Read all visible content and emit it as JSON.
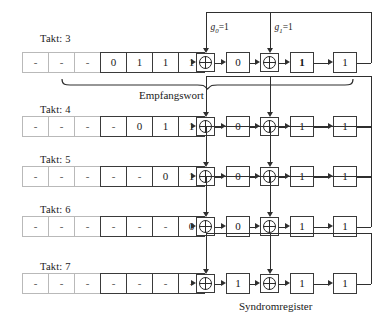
{
  "figure": {
    "title_visible": false,
    "colors": {
      "ink": "#2f2f2f",
      "faint_border": "#b9b9b9",
      "strong_border": "#3a3a3a",
      "background": "#ffffff"
    }
  },
  "taps": {
    "g0": "g",
    "g0_sub": "0",
    "g0_eq": "=1",
    "g1": "g",
    "g1_sub": "1",
    "g1_eq": "=1"
  },
  "captions": {
    "empfangswort": "Empfangswort",
    "syndromregister": "Syndromregister"
  },
  "rows": [
    {
      "takt_label": "Takt: 3",
      "input_cells": [
        "-",
        "-",
        "-",
        "0",
        "1",
        "1",
        "1"
      ],
      "input_cell_styles": [
        "faint",
        "faint",
        "faint",
        "strong",
        "strong",
        "strong",
        "strong"
      ],
      "registers": [
        "0",
        "1",
        "1"
      ],
      "register_bold": [
        false,
        true,
        false
      ],
      "xor_count": 2
    },
    {
      "takt_label": "Takt: 4",
      "input_cells": [
        "-",
        "-",
        "-",
        "-",
        "0",
        "1",
        "1"
      ],
      "input_cell_styles": [
        "faint",
        "faint",
        "faint",
        "strong",
        "strong",
        "strong",
        "strong"
      ],
      "registers": [
        "0",
        "1",
        "1"
      ],
      "register_bold": [
        false,
        false,
        false
      ],
      "xor_count": 2
    },
    {
      "takt_label": "Takt: 5",
      "input_cells": [
        "-",
        "-",
        "-",
        "-",
        "-",
        "0",
        "1"
      ],
      "input_cell_styles": [
        "faint",
        "faint",
        "faint",
        "strong",
        "strong",
        "strong",
        "strong"
      ],
      "registers": [
        "0",
        "1",
        "1"
      ],
      "register_bold": [
        false,
        false,
        false
      ],
      "xor_count": 2
    },
    {
      "takt_label": "Takt: 6",
      "input_cells": [
        "-",
        "-",
        "-",
        "-",
        "-",
        "-",
        "0"
      ],
      "input_cell_styles": [
        "faint",
        "faint",
        "faint",
        "strong",
        "strong",
        "strong",
        "strong"
      ],
      "registers": [
        "0",
        "1",
        "1"
      ],
      "register_bold": [
        false,
        false,
        false
      ],
      "xor_count": 2
    },
    {
      "takt_label": "Takt: 7",
      "input_cells": [
        "-",
        "-",
        "-",
        "-",
        "-",
        "-",
        "-"
      ],
      "input_cell_styles": [
        "faint",
        "faint",
        "faint",
        "strong",
        "strong",
        "strong",
        "strong"
      ],
      "registers": [
        "1",
        "1",
        "1"
      ],
      "register_bold": [
        false,
        false,
        false
      ],
      "xor_count": 2
    }
  ]
}
